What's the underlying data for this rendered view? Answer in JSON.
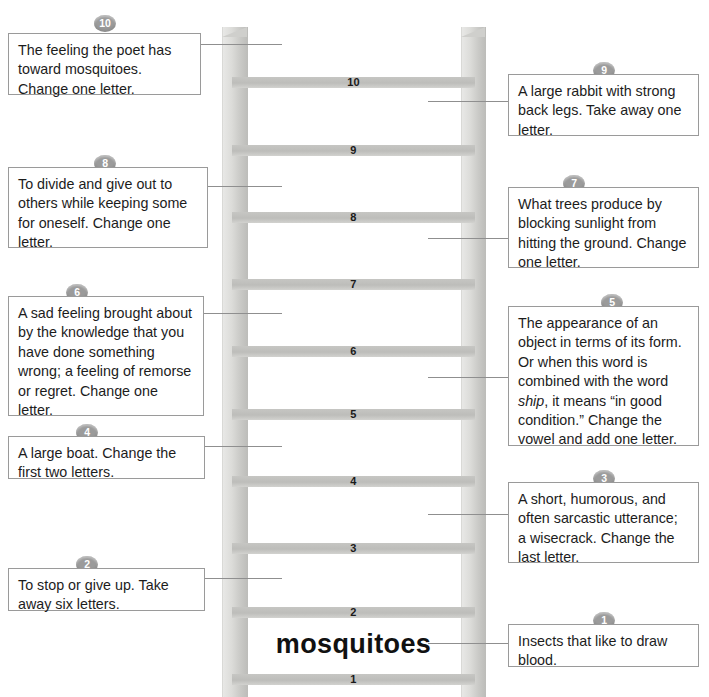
{
  "puzzle": {
    "answer_word": "mosquitoes",
    "ladder": {
      "rung_numbers": [
        "10",
        "9",
        "8",
        "7",
        "6",
        "5",
        "4",
        "3",
        "2",
        "1"
      ]
    }
  },
  "clues": {
    "left": [
      {
        "number": "10",
        "text": "The feeling the poet has toward mosquitoes.  Change one letter."
      },
      {
        "number": "8",
        "text": "To divide and give out to others while keeping some for oneself.  Change one letter."
      },
      {
        "number": "6",
        "text": "A sad feeling brought about by the knowledge that you have done something wrong; a feeling of remorse or regret.  Change one letter."
      },
      {
        "number": "4",
        "text": "A large boat.  Change the first two letters."
      },
      {
        "number": "2",
        "text": "To stop or give up.  Take away six letters."
      }
    ],
    "right": [
      {
        "number": "9",
        "text": "A large rabbit with strong back legs.  Take away one letter."
      },
      {
        "number": "7",
        "text": "What trees produce by blocking sunlight from hitting the ground. Change one letter."
      },
      {
        "number": "5",
        "text_before": "The appearance of an object in terms of its form. Or when this word is combined with the word ",
        "emphasis": "ship",
        "text_after": ", it means “in good condition.”  Change the vowel and add one letter."
      },
      {
        "number": "3",
        "text": "A short, humorous, and often sarcastic utterance; a wisecrack.  Change the last letter."
      },
      {
        "number": "1",
        "text": "Insects that like to draw blood."
      }
    ]
  },
  "colors": {
    "badge": "#9b9b9b",
    "rail": "#cfcfcc",
    "rung": "#bdbdba",
    "box_border": "#9a9a9a",
    "connector": "#8f8f8f",
    "text": "#1c1c1c"
  }
}
